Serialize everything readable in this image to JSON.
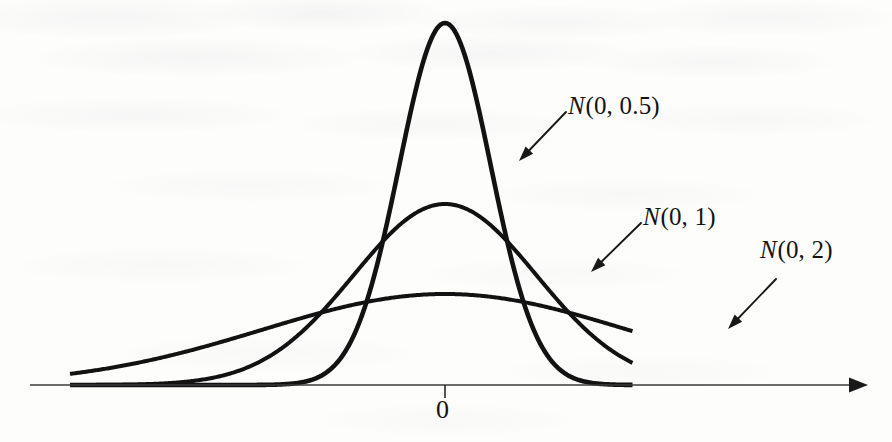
{
  "figure": {
    "background_color": "#fdfdfc",
    "curve_color": "#121212",
    "axis_color": "#3b3b3b"
  },
  "axis": {
    "origin_tick_label": "0",
    "has_right_arrowhead": true,
    "x_start_px": 30,
    "x_end_px": 868,
    "y_px": 385,
    "origin_x_px": 445
  },
  "labels": [
    {
      "id": "label-n-0-0-5",
      "prefix": "N",
      "args": "(0, 0.5)",
      "text": "N(0,0.5)",
      "x_px": 568,
      "y_px": 92
    },
    {
      "id": "label-n-0-1",
      "prefix": "N",
      "args": "(0, 1)",
      "text": "N(0,1)",
      "x_px": 643,
      "y_px": 203
    },
    {
      "id": "label-n-0-2",
      "prefix": "N",
      "args": "(0, 2)",
      "text": "N(0,2)",
      "x_px": 760,
      "y_px": 236
    }
  ],
  "pointers": [
    {
      "id": "pointer-n-0-0-5",
      "x1": 566,
      "y1": 112,
      "x2": 519,
      "y2": 161
    },
    {
      "id": "pointer-n-0-1",
      "x1": 641,
      "y1": 223,
      "x2": 591,
      "y2": 272
    },
    {
      "id": "pointer-n-0-2",
      "x1": 776,
      "y1": 279,
      "x2": 728,
      "y2": 329
    }
  ],
  "chart_data": {
    "type": "line",
    "xlabel": "",
    "ylabel": "",
    "grid": false,
    "legend": "inline-annotations",
    "x_tick_labels": [
      "0"
    ],
    "x_ticks": [
      0
    ],
    "xlim": [
      -4.45,
      3.75
    ],
    "ylim": [
      0,
      0.88
    ],
    "annotations": [
      "N(0,0.5)",
      "N(0,1)",
      "N(0,2)"
    ],
    "series": [
      {
        "name": "N(0,0.5)",
        "mean": 0,
        "sigma": 0.5,
        "peak_value": 0.798,
        "peak_height_px": 362,
        "stroke_width_px": 4.6,
        "x_range": [
          -4.1,
          2.05
        ]
      },
      {
        "name": "N(0,1)",
        "mean": 0,
        "sigma": 1,
        "peak_value": 0.399,
        "peak_height_px": 181,
        "stroke_width_px": 4.0,
        "x_range": [
          -4.1,
          2.05
        ]
      },
      {
        "name": "N(0,2)",
        "mean": 0,
        "sigma": 2,
        "peak_value": 0.199,
        "peak_height_px": 91,
        "stroke_width_px": 4.0,
        "x_range": [
          -4.1,
          2.05
        ]
      }
    ]
  }
}
